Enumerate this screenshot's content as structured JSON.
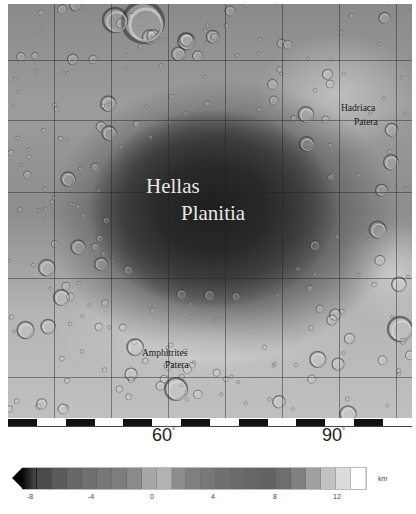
{
  "map": {
    "title": "Hellas Planitia region, Mars",
    "features": [
      {
        "id": "hellas-planitia",
        "lines": [
          "Hellas",
          "Planitia"
        ],
        "style": "light"
      },
      {
        "id": "hadriaca-patera",
        "lines": [
          "Hadriaca",
          "Patera"
        ],
        "style": "dark"
      },
      {
        "id": "amphitrites-patera",
        "lines": [
          "Amphitrites",
          "Patera"
        ],
        "style": "dark"
      }
    ],
    "longitude_labels": [
      {
        "value": "60",
        "unit": "°"
      },
      {
        "value": "90",
        "unit": "°"
      }
    ],
    "grid": {
      "vertical_px": [
        46,
        103,
        160,
        217,
        274,
        331,
        388
      ],
      "horizontal_px": [
        56,
        116,
        188,
        274,
        373
      ]
    },
    "scale_bar_segments": 14
  },
  "colorbar": {
    "unit": "km",
    "tick_labels": [
      "-8",
      "-4",
      "0",
      "4",
      "8",
      "12"
    ],
    "min": -8,
    "max": 14,
    "extend": "min",
    "colors": [
      "#121212",
      "#4a4a4a",
      "#5a5a5a",
      "#666666",
      "#6f6f6f",
      "#777777",
      "#7d7d7d",
      "#8a8a8a",
      "#a6a6a6",
      "#b2b2b2",
      "#8c8c8c",
      "#7f7f7f",
      "#787878",
      "#707070",
      "#6a6a6a",
      "#666666",
      "#636363",
      "#6e6e6e",
      "#808080",
      "#a0a0a0",
      "#c2c2c2",
      "#dcdcdc",
      "#ffffff"
    ]
  }
}
